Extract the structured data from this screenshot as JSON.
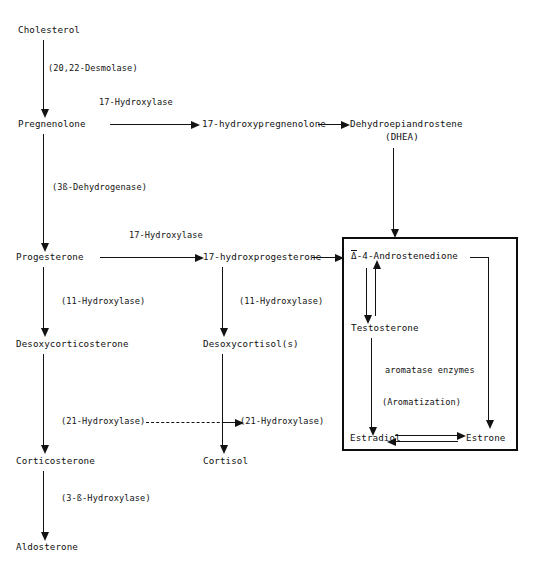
{
  "diagram": {
    "type": "biochemical-pathway-flowchart",
    "ink_color": "#121212",
    "background_color": "#ffffff"
  },
  "nodes": {
    "cholesterol": "Cholesterol",
    "pregnenolone": "Pregnenolone",
    "hydroxypregnenolone": "17-hydroxypregnenolone",
    "dhea_line1": "Dehydroepiandrostene",
    "dhea_line2": "(DHEA)",
    "progesterone": "Progesterone",
    "hydroxprogesterone": "17-hydroxprogesterone",
    "desoxycorticosterone": "Desoxycorticosterone",
    "desoxycortisol": "Desoxycortisol(s)",
    "corticosterone": "Corticosterone",
    "cortisol": "Cortisol",
    "aldosterone": "Aldosterone",
    "androstenedione_symbol": "Δ",
    "androstenedione_text": "-4-Androstenedione",
    "testosterone": "Testosterone",
    "estradiol": "Estradiol",
    "estrone": "Estrone"
  },
  "enzymes": {
    "desmolase": "(20,22-Desmolase)",
    "hydroxylase17_top": "17-Hydroxylase",
    "dehydrogenase3b": "(3ß-Dehydrogenase)",
    "hydroxylase17_mid": "17-Hydroxylase",
    "hydroxylase11_left": "(11-Hydroxylase)",
    "hydroxylase11_mid": "(11-Hydroxylase)",
    "hydroxylase21_left": "(21-Hydroxylase)",
    "hydroxylase21_mid": "(21-Hydroxylase)",
    "hydroxylase3b": "(3-ß-Hydroxylase)",
    "aromatase_enzymes": "aromatase enzymes",
    "aromatization": "(Aromatization)"
  }
}
